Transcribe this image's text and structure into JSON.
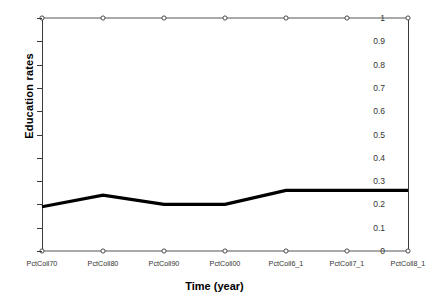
{
  "chart_data": {
    "type": "line",
    "title": "",
    "xlabel": "Time (year)",
    "ylabel": "Education rates",
    "categories": [
      "PctColl70",
      "PctColl80",
      "PctColl90",
      "PctColl00",
      "PctColl6_1",
      "PctColl7_1",
      "PctColl8_1"
    ],
    "ylim": [
      0,
      1
    ],
    "ytick_labels": [
      "1",
      "0.9",
      "0.8",
      "0.7",
      "0.6",
      "0.5",
      "0.4",
      "0.3",
      "0.2",
      "0.1",
      "0"
    ],
    "ytick_values": [
      1,
      0.9,
      0.8,
      0.7,
      0.6,
      0.5,
      0.4,
      0.3,
      0.2,
      0.1,
      0
    ],
    "grid": false,
    "legend": "none",
    "series": [
      {
        "name": "max",
        "values": [
          1,
          1,
          1,
          1,
          1,
          1,
          1
        ],
        "color": "#555555",
        "width": 1,
        "marker": "circle-open"
      },
      {
        "name": "mean",
        "values": [
          0.19,
          0.24,
          0.2,
          0.2,
          0.26,
          0.26,
          0.26
        ],
        "color": "#000000",
        "width": 3.2,
        "marker": "none"
      },
      {
        "name": "min",
        "values": [
          0,
          0,
          0,
          0,
          0,
          0,
          0
        ],
        "color": "#555555",
        "width": 1,
        "marker": "circle-open"
      }
    ]
  }
}
